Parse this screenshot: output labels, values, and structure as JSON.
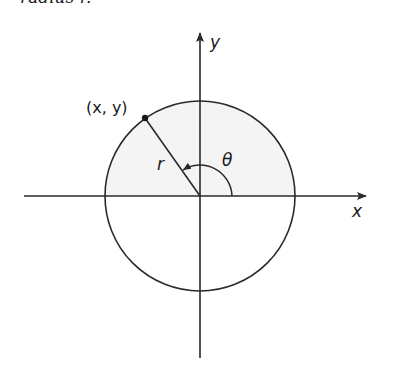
{
  "caption": {
    "text": "radius r."
  },
  "figure": {
    "type": "polar-coordinates-diagram",
    "axes": {
      "x_label": "x",
      "y_label": "y"
    },
    "point": {
      "label": "(x, y)"
    },
    "radius_label": "r",
    "angle_label": "θ",
    "colors": {
      "stroke": "#2a2a2a",
      "upper_half_fill": "#f4f4f4",
      "background": "#ffffff"
    }
  }
}
